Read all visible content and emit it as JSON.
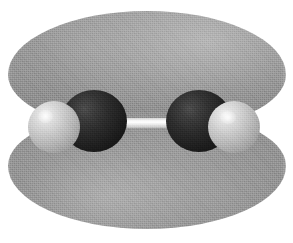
{
  "figure": {
    "kind": "molecular-orbital-surface-render",
    "caption": "",
    "rendering_style": "space-filling spheres with translucent isosurface lobes",
    "background_color": "#ffffff",
    "canvas": {
      "width": 293,
      "height": 243
    }
  },
  "molecule": {
    "name": "acetylene",
    "formula": "C2H2",
    "geometry": "linear",
    "axis": "horizontal",
    "atoms": [
      {
        "id": "hydrogen-left",
        "element": "H",
        "label": "H",
        "color": "#c9c9c9",
        "radius_px": 26,
        "center": {
          "x": 54,
          "y": 127
        }
      },
      {
        "id": "carbon-left",
        "element": "C",
        "label": "C",
        "color": "#1e1e1e",
        "radius_px": 33,
        "center": {
          "x": 94,
          "y": 121
        }
      },
      {
        "id": "carbon-right",
        "element": "C",
        "label": "C",
        "color": "#1e1e1e",
        "radius_px": 33,
        "center": {
          "x": 199,
          "y": 121
        }
      },
      {
        "id": "hydrogen-right",
        "element": "H",
        "label": "H",
        "color": "#c9c9c9",
        "radius_px": 26,
        "center": {
          "x": 234,
          "y": 127
        }
      }
    ],
    "bonds": [
      {
        "id": "bond-cc",
        "from": "carbon-left",
        "to": "carbon-right",
        "color": "#ffffff",
        "style": "cylinder"
      }
    ]
  },
  "orbital": {
    "type": "pi",
    "description": "two-lobed isosurface above and below the internuclear axis",
    "lobe_color": "#8a8a8a",
    "lobes": [
      {
        "id": "lobe-upper",
        "position": "above-axis",
        "sign": "+"
      },
      {
        "id": "lobe-lower",
        "position": "below-axis",
        "sign": "-"
      }
    ]
  }
}
